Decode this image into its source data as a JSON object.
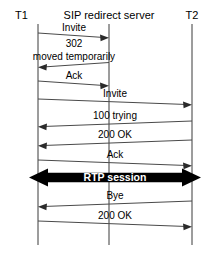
{
  "diagram": {
    "type": "sequence-diagram",
    "background_color": "#ffffff",
    "line_color": "#4a4a4a",
    "text_color": "#000000",
    "highlight_color": "#000000",
    "highlight_text_color": "#ffffff"
  },
  "lifelines": [
    {
      "id": "t1",
      "label": "T1",
      "x": 38
    },
    {
      "id": "server",
      "label": "SIP redirect server",
      "x": 109
    },
    {
      "id": "t2",
      "label": "T2",
      "x": 192
    }
  ],
  "messages": [
    {
      "id": "m1",
      "label": "Invite",
      "from": "t1",
      "to": "server",
      "direction": "right",
      "y_start": 29,
      "y_end": 34,
      "x_from": 38,
      "x_to": 109
    },
    {
      "id": "m2",
      "label_line1": "302",
      "label_line2": "moved temporarily",
      "label": "302 moved temporarily",
      "from": "server",
      "to": "t1",
      "direction": "left",
      "y_start": 62,
      "y_end": 67,
      "x_from": 109,
      "x_to": 38
    },
    {
      "id": "m3",
      "label": "Ack",
      "from": "t1",
      "to": "server",
      "direction": "right",
      "y_start": 76,
      "y_end": 81,
      "x_from": 38,
      "x_to": 109
    },
    {
      "id": "m4",
      "label": "Invite",
      "from": "t1",
      "to": "t2",
      "direction": "right",
      "y_start": 96,
      "y_end": 102,
      "x_from": 38,
      "x_to": 192
    },
    {
      "id": "m5",
      "label": "100 trying",
      "from": "t2",
      "to": "t1",
      "direction": "left",
      "y_start": 120,
      "y_end": 114,
      "x_from": 192,
      "x_to": 38
    },
    {
      "id": "m6",
      "label": "200 OK",
      "from": "t2",
      "to": "t1",
      "direction": "left",
      "y_start": 142,
      "y_end": 136,
      "x_from": 192,
      "x_to": 38
    },
    {
      "id": "m7",
      "label": "Ack",
      "from": "t1",
      "to": "t2",
      "direction": "right",
      "y_start": 157,
      "y_end": 163,
      "x_from": 38,
      "x_to": 192
    },
    {
      "id": "m8",
      "label": "RTP session",
      "from": "t1",
      "to": "t2",
      "direction": "both",
      "style": "thick-bar",
      "y_start": 169,
      "y_end": 184,
      "x_from": 30,
      "x_to": 200
    },
    {
      "id": "m9",
      "label": "Bye",
      "from": "t2",
      "to": "t1",
      "direction": "left",
      "y_start": 204,
      "y_end": 198,
      "x_from": 192,
      "x_to": 38
    },
    {
      "id": "m10",
      "label": "200 OK",
      "from": "t1",
      "to": "t2",
      "direction": "right",
      "y_start": 219,
      "y_end": 225,
      "x_from": 38,
      "x_to": 192
    }
  ],
  "labels": {
    "t1": "T1",
    "server": "SIP redirect server",
    "t2": "T2",
    "invite_1": "Invite",
    "code_302": "302",
    "moved_temporarily": "moved temporarily",
    "ack_1": "Ack",
    "invite_2": "Invite",
    "trying_100": "100 trying",
    "ok_200_a": "200 OK",
    "ack_2": "Ack",
    "rtp_session": "RTP session",
    "bye": "Bye",
    "ok_200_b": "200 OK"
  }
}
